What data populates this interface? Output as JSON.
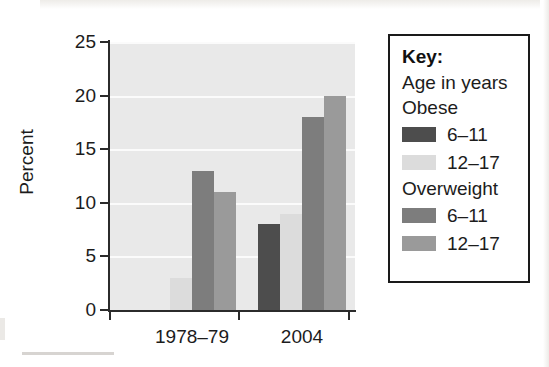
{
  "chart_data": {
    "type": "bar",
    "title": "",
    "xlabel": "",
    "ylabel": "Percent",
    "categories": [
      "1978–79",
      "2004"
    ],
    "ylim": [
      0,
      25
    ],
    "yticks": [
      0,
      5,
      10,
      15,
      20,
      25
    ],
    "grid": true,
    "legend_position": "right",
    "series": [
      {
        "name": "Obese 6–11",
        "group": "Obese",
        "age": "6–11",
        "color": "#4d4d4d",
        "values": [
          0,
          8
        ]
      },
      {
        "name": "Obese 12–17",
        "group": "Obese",
        "age": "12–17",
        "color": "#dcdcdc",
        "values": [
          3,
          9
        ]
      },
      {
        "name": "Overweight 6–11",
        "group": "Overweight",
        "age": "6–11",
        "color": "#7d7d7d",
        "values": [
          13,
          18
        ]
      },
      {
        "name": "Overweight 12–17",
        "group": "Overweight",
        "age": "12–17",
        "color": "#9a9a9a",
        "values": [
          11,
          20
        ]
      }
    ]
  },
  "axis": {
    "y_title": "Percent",
    "y_tick_labels": [
      "25",
      "20",
      "15",
      "10",
      "5",
      "0"
    ],
    "x_tick_labels": [
      "1978–79",
      "2004"
    ]
  },
  "legend": {
    "title": "Key:",
    "subtitle": "Age in years",
    "groups": [
      {
        "name": "Obese",
        "entries": [
          {
            "label": "6–11",
            "color": "#4d4d4d"
          },
          {
            "label": "12–17",
            "color": "#dcdcdc"
          }
        ]
      },
      {
        "name": "Overweight",
        "entries": [
          {
            "label": "6–11",
            "color": "#7d7d7d"
          },
          {
            "label": "12–17",
            "color": "#9a9a9a"
          }
        ]
      }
    ]
  },
  "colors": {
    "plot_background": "#e9e9e9",
    "gridline": "#fbfbfb",
    "axis": "#2b2b2b",
    "text": "#1c1c1c",
    "page_background": "#ffffff"
  }
}
